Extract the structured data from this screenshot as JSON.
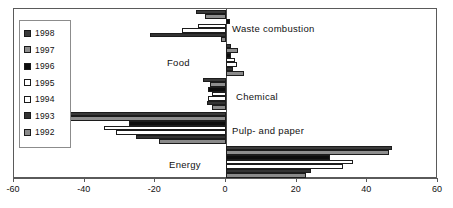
{
  "chart_data": {
    "type": "bar",
    "orientation": "horizontal",
    "title": "",
    "xlabel": "",
    "ylabel": "",
    "xlim": [
      -60,
      60
    ],
    "xticks": [
      -60,
      -40,
      -20,
      0,
      20,
      40,
      60
    ],
    "xticklabels": [
      "-60",
      "-40",
      "-20",
      "0",
      "20",
      "40",
      "60"
    ],
    "grid": false,
    "legend_position": "upper-left",
    "categories": [
      "Waste combustion",
      "Food",
      "Chemical",
      "Pulp- and paper",
      "Energy"
    ],
    "series": [
      {
        "name": "1998",
        "color": "#3a3a3a",
        "values": [
          -8.5,
          1.5,
          -6.5,
          -45.5,
          47.0
        ]
      },
      {
        "name": "1997",
        "color": "#8e8e8e",
        "values": [
          -6.0,
          3.5,
          -4.5,
          -44.5,
          46.0
        ]
      },
      {
        "name": "1996",
        "color": "#0d0d0d",
        "values": [
          1.0,
          1.5,
          -5.0,
          -27.5,
          29.5
        ]
      },
      {
        "name": "1995",
        "color": "#ffffff",
        "values": [
          -8.0,
          2.5,
          -4.0,
          -34.5,
          36.0
        ]
      },
      {
        "name": "1994",
        "color": "#ffffff",
        "values": [
          -12.5,
          3.0,
          -5.0,
          -31.0,
          33.0
        ]
      },
      {
        "name": "1993",
        "color": "#333333",
        "values": [
          -21.5,
          2.0,
          -5.5,
          -25.5,
          24.0
        ]
      },
      {
        "name": "1992",
        "color": "#8a8a8a",
        "values": [
          -1.5,
          5.0,
          -4.0,
          -19.0,
          22.5
        ]
      }
    ]
  },
  "legend": {
    "items": [
      {
        "label": "1998",
        "color": "#3a3a3a"
      },
      {
        "label": "1997",
        "color": "#8e8e8e"
      },
      {
        "label": "1996",
        "color": "#0d0d0d"
      },
      {
        "label": "1995",
        "color": "#ffffff"
      },
      {
        "label": "1994",
        "color": "#ffffff"
      },
      {
        "label": "1993",
        "color": "#333333"
      },
      {
        "label": "1992",
        "color": "#8a8a8a"
      }
    ]
  },
  "axis": {
    "labels": [
      "-60",
      "-40",
      "-20",
      "0",
      "20",
      "40",
      "60"
    ]
  },
  "category_labels": {
    "waste": "Waste combustion",
    "food": "Food",
    "chemical": "Chemical",
    "pulp": "Pulp- and paper",
    "energy": "Energy"
  }
}
